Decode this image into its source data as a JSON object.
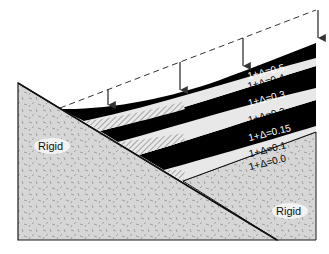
{
  "diagram": {
    "type": "cross-section",
    "regions": {
      "left_rigid": {
        "label": "Rigid"
      },
      "right_rigid": {
        "label": "Rigid"
      }
    },
    "bands": [
      {
        "label": "1+Δ=0.5",
        "fill": "#000000",
        "text_color": "#ffffff"
      },
      {
        "label": "1+Δ=0.4",
        "fill": "#e6e6e6",
        "text_color": "#000000"
      },
      {
        "label": "1+Δ=0.3",
        "fill": "#000000",
        "text_color": "#ffffff"
      },
      {
        "label": "1+Δ=0.2",
        "fill": "#e6e6e6",
        "text_color": "#000000"
      },
      {
        "label": "1+Δ=0.15",
        "fill": "#000000",
        "text_color": "#ffffff"
      },
      {
        "label": "1+Δ=0.1",
        "fill": "#e6e6e6",
        "text_color": "#000000"
      },
      {
        "label": "1+Δ=0.0",
        "fill": "#d4d4d4",
        "text_color": "#000000"
      }
    ],
    "arrows_count": 4,
    "colors": {
      "rigid_fill": "#d6d6d6",
      "band_dark": "#000000",
      "band_light": "#e8e8e8",
      "outline": "#1a1a1a"
    }
  }
}
